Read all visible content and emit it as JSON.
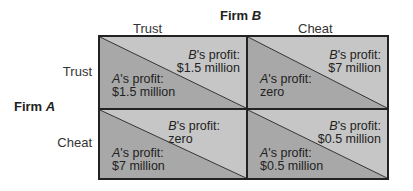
{
  "title": {
    "firm_b": "Firm B",
    "firm_a": "Firm A"
  },
  "columns": [
    {
      "label": "Trust"
    },
    {
      "label": "Cheat"
    }
  ],
  "rows": [
    {
      "label": "Trust"
    },
    {
      "label": "Cheat"
    }
  ],
  "cells": [
    {
      "row": "Trust",
      "col": "Trust",
      "b_label": "'s profit:",
      "b_value": "$1.5 million",
      "a_label": "'s profit:",
      "a_value": "$1.5 million"
    },
    {
      "row": "Trust",
      "col": "Cheat",
      "b_label": "'s profit:",
      "b_value": "$7 million",
      "a_label": "'s profit:",
      "a_value": "zero"
    },
    {
      "row": "Cheat",
      "col": "Trust",
      "b_label": "'s profit:",
      "b_value": "zero",
      "a_label": "'s profit:",
      "a_value": "$7 million"
    },
    {
      "row": "Cheat",
      "col": "Cheat",
      "b_label": "'s profit:",
      "b_value": "$0.5 million",
      "a_label": "'s profit:",
      "a_value": "$0.5 million"
    }
  ],
  "colors": {
    "upper_triangle": "#c6c6c6",
    "lower_triangle": "#a8a8a8",
    "border": "#222222"
  }
}
